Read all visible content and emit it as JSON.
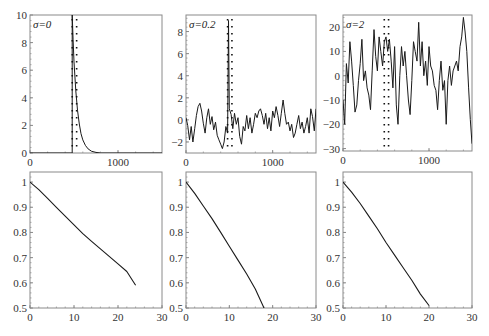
{
  "chart_data": [
    {
      "type": "line",
      "panel": "top-left",
      "annotation": "σ=0",
      "xlim": [
        0,
        1500
      ],
      "ylim": [
        0,
        10
      ],
      "xticks": [
        0,
        1000
      ],
      "yticks": [
        0,
        2,
        4,
        6,
        8,
        10
      ],
      "series": [
        {
          "name": "signal",
          "style": "solid",
          "x": [
            0,
            480,
            480,
            490,
            500,
            520,
            540,
            560,
            580,
            600,
            630,
            660,
            700,
            750,
            800,
            1500
          ],
          "y": [
            0,
            0,
            10,
            8.2,
            6.6,
            4.5,
            3.1,
            2.1,
            1.4,
            0.95,
            0.55,
            0.3,
            0.12,
            0.04,
            0.0,
            0.0
          ]
        },
        {
          "name": "window-left",
          "style": "dotted-vertical",
          "x": 480
        },
        {
          "name": "window-right",
          "style": "dotted-vertical",
          "x": 530
        }
      ]
    },
    {
      "type": "line",
      "panel": "top-middle",
      "annotation": "σ=0.2",
      "xlim": [
        0,
        1500
      ],
      "ylim": [
        -3,
        9.5
      ],
      "xticks": [
        0,
        1000
      ],
      "yticks": [
        -2,
        0,
        2,
        4,
        6,
        8
      ],
      "series": [
        {
          "name": "signal",
          "style": "solid",
          "x": [
            0,
            20,
            40,
            60,
            80,
            100,
            120,
            140,
            160,
            180,
            200,
            220,
            240,
            260,
            280,
            300,
            320,
            340,
            360,
            380,
            400,
            420,
            440,
            460,
            480,
            490,
            500,
            520,
            540,
            560,
            580,
            600,
            620,
            640,
            660,
            680,
            700,
            720,
            740,
            760,
            780,
            800,
            820,
            840,
            860,
            880,
            900,
            920,
            940,
            960,
            980,
            1000,
            1020,
            1040,
            1060,
            1080,
            1100,
            1120,
            1140,
            1160,
            1180,
            1200,
            1220,
            1240,
            1260,
            1280,
            1300,
            1320,
            1340,
            1360,
            1380,
            1400,
            1420,
            1440,
            1460,
            1480,
            1500
          ],
          "y": [
            0.2,
            -0.5,
            -1.8,
            -0.6,
            -2.0,
            -0.8,
            0.4,
            1.2,
            1.5,
            0.8,
            -0.3,
            -1.2,
            0.2,
            1.0,
            -0.4,
            0.3,
            -0.9,
            -0.2,
            -1.4,
            -1.8,
            -2.2,
            -2.6,
            -2.0,
            -0.6,
            -1.2,
            9.0,
            1.0,
            0.5,
            -0.8,
            0.6,
            -0.4,
            0.2,
            -1.5,
            -2.2,
            -0.6,
            -1.0,
            0.4,
            -0.8,
            0.2,
            -1.2,
            -0.4,
            0.6,
            0.2,
            0.8,
            1.0,
            0.4,
            -0.4,
            0.6,
            -0.8,
            0.2,
            -1.0,
            0.8,
            0.2,
            1.2,
            0.4,
            -0.6,
            0.6,
            1.8,
            0.6,
            -0.4,
            -0.2,
            -1.0,
            -0.4,
            -1.6,
            -1.2,
            -0.4,
            0.4,
            -0.8,
            -0.2,
            -1.2,
            -0.6,
            0.2,
            -1.2,
            1.0,
            0.3,
            -1.0,
            1.0
          ]
        },
        {
          "name": "window-left",
          "style": "dotted-vertical",
          "x": 480
        },
        {
          "name": "window-right",
          "style": "dotted-vertical",
          "x": 530
        }
      ]
    },
    {
      "type": "line",
      "panel": "top-right",
      "annotation": "σ=2",
      "xlim": [
        0,
        1500
      ],
      "ylim": [
        -31,
        25
      ],
      "xticks": [
        0,
        1000
      ],
      "yticks": [
        -30,
        -20,
        -10,
        0,
        10,
        20
      ],
      "series": [
        {
          "name": "signal",
          "style": "solid",
          "x": [
            0,
            20,
            40,
            60,
            80,
            100,
            120,
            140,
            160,
            180,
            200,
            220,
            240,
            260,
            280,
            300,
            320,
            340,
            360,
            380,
            400,
            420,
            440,
            460,
            480,
            500,
            520,
            540,
            560,
            580,
            600,
            620,
            640,
            660,
            680,
            700,
            720,
            740,
            760,
            780,
            800,
            820,
            840,
            860,
            880,
            900,
            920,
            940,
            960,
            980,
            1000,
            1020,
            1040,
            1060,
            1080,
            1100,
            1120,
            1140,
            1160,
            1180,
            1200,
            1220,
            1240,
            1260,
            1280,
            1300,
            1320,
            1340,
            1360,
            1380,
            1400,
            1420,
            1440,
            1460,
            1480,
            1500
          ],
          "y": [
            -10,
            -20,
            5,
            -3,
            14,
            6,
            -4,
            -15,
            -12,
            -2,
            5,
            15,
            -2,
            2,
            -5,
            -8,
            -14,
            2,
            19,
            8,
            2,
            16,
            10,
            4,
            14,
            16,
            10,
            15,
            6,
            -5,
            12,
            -12,
            -20,
            0,
            12,
            4,
            10,
            0,
            -10,
            -16,
            -2,
            14,
            10,
            6,
            22,
            4,
            14,
            0,
            6,
            -4,
            12,
            4,
            2,
            -4,
            -6,
            -14,
            -2,
            6,
            -6,
            -2,
            -20,
            -2,
            4,
            -4,
            2,
            4,
            6,
            2,
            12,
            16,
            24,
            18,
            10,
            -5,
            -18,
            -28
          ]
        },
        {
          "name": "window-left",
          "style": "dotted-vertical",
          "x": 480
        },
        {
          "name": "window-right",
          "style": "dotted-vertical",
          "x": 530
        }
      ]
    },
    {
      "type": "line",
      "panel": "bottom-left",
      "xlim": [
        0,
        30
      ],
      "ylim": [
        0.5,
        1.04
      ],
      "xticks": [
        0,
        10,
        20,
        30
      ],
      "yticks": [
        0.5,
        0.6,
        0.7,
        0.8,
        0.9,
        1
      ],
      "series": [
        {
          "name": "curve",
          "style": "solid",
          "x": [
            0,
            2,
            4,
            6,
            8,
            10,
            12,
            14,
            16,
            18,
            20,
            22,
            24
          ],
          "y": [
            1.0,
            0.97,
            0.935,
            0.9,
            0.865,
            0.83,
            0.795,
            0.765,
            0.735,
            0.705,
            0.675,
            0.645,
            0.59
          ]
        }
      ]
    },
    {
      "type": "line",
      "panel": "bottom-middle",
      "xlim": [
        0,
        30
      ],
      "ylim": [
        0.5,
        1.04
      ],
      "xticks": [
        0,
        10,
        20,
        30
      ],
      "yticks": [
        0.5,
        0.6,
        0.7,
        0.8,
        0.9,
        1
      ],
      "series": [
        {
          "name": "curve",
          "style": "solid",
          "x": [
            0,
            2,
            4,
            6,
            8,
            10,
            12,
            14,
            16,
            18
          ],
          "y": [
            1.0,
            0.955,
            0.905,
            0.855,
            0.8,
            0.745,
            0.69,
            0.635,
            0.575,
            0.5
          ]
        }
      ]
    },
    {
      "type": "line",
      "panel": "bottom-right",
      "xlim": [
        0,
        30
      ],
      "ylim": [
        0.5,
        1.04
      ],
      "xticks": [
        0,
        10,
        20,
        30
      ],
      "yticks": [
        0.5,
        0.6,
        0.7,
        0.8,
        0.9,
        1
      ],
      "series": [
        {
          "name": "curve",
          "style": "solid",
          "x": [
            0,
            2,
            4,
            6,
            8,
            10,
            12,
            14,
            16,
            18,
            20
          ],
          "y": [
            1.0,
            0.96,
            0.915,
            0.865,
            0.815,
            0.76,
            0.71,
            0.66,
            0.61,
            0.555,
            0.51
          ]
        }
      ]
    }
  ],
  "layout": {
    "panels": [
      {
        "x": 30,
        "y": 15,
        "w": 132,
        "h": 138
      },
      {
        "x": 186,
        "y": 15,
        "w": 130,
        "h": 138
      },
      {
        "x": 343,
        "y": 15,
        "w": 129,
        "h": 136
      },
      {
        "x": 30,
        "y": 172,
        "w": 132,
        "h": 136
      },
      {
        "x": 186,
        "y": 172,
        "w": 130,
        "h": 136
      },
      {
        "x": 343,
        "y": 172,
        "w": 129,
        "h": 136
      }
    ],
    "frame_color": "#8a8a8a",
    "line_color": "#1a1a1a"
  }
}
